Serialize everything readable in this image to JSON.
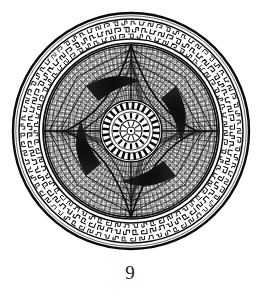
{
  "figure": {
    "caption": "9",
    "title": "Circular mosaic medallion",
    "background_color": "#ffffff",
    "ink_color": "#111111",
    "mid_tone_color": "#5b5b5b",
    "light_tone_color": "#9a9a9a"
  },
  "geometry": {
    "center_x": 131,
    "center_y": 131,
    "outer_rim_radius": 118,
    "outer_rim_stroke": 2.2,
    "band_outer_radius": 112,
    "band_inner_radius": 92,
    "field_radius": 88,
    "field_ring_stroke": 1.6,
    "star_outer_radius": 86,
    "star_waist_radius": 30,
    "crescent_orbit_radius": 58,
    "rosette_outer_radius": 31,
    "rosette_tick_outer_radius": 29,
    "rosette_tick_inner_radius": 22,
    "rosette_mid_radius": 19,
    "rosette_hub_radius": 11,
    "rosette_core_radius": 4
  },
  "structure": {
    "rings": [
      {
        "name": "outer-rim-circle",
        "radius": 118,
        "style": "solid heavy line"
      },
      {
        "name": "border-band-outer-circle",
        "radius": 112,
        "style": "solid line"
      },
      {
        "name": "scroll-band",
        "radius_outer": 112,
        "radius_inner": 92,
        "style": "dense scroll / meander motifs"
      },
      {
        "name": "border-band-inner-circle",
        "radius": 92,
        "style": "solid line"
      },
      {
        "name": "field-boundary-circle",
        "radius": 88,
        "style": "solid line"
      },
      {
        "name": "tessellated-field",
        "radius": 88,
        "style": "radial-concentric mosaic grid"
      },
      {
        "name": "central-rosette",
        "radius": 31,
        "style": "concentric rings with radial dashes"
      }
    ],
    "scroll_motif_count": 72,
    "star_point_count": 4,
    "star_point_angles_deg": [
      270,
      0,
      90,
      180
    ],
    "crescent_count": 4,
    "crescent_angles_deg": [
      315,
      45,
      135,
      225
    ],
    "radial_spoke_count": 96,
    "concentric_course_count": 15,
    "rosette_tick_count": 28,
    "rosette_inner_tick_count": 16
  },
  "labels": {
    "plate_number": "9",
    "figure_alt": "Plate 9 — circular mosaic medallion"
  }
}
